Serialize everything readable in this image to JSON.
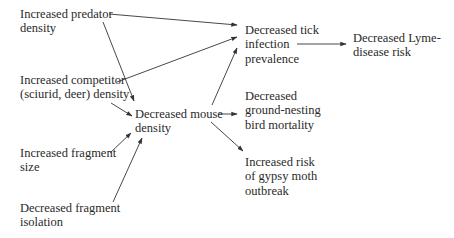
{
  "diagram": {
    "type": "flowchart",
    "nodes": {
      "predator": {
        "lines": [
          "Increased predator",
          "density"
        ]
      },
      "competitor": {
        "lines": [
          "Increased competitor",
          "(sciurid, deer) density"
        ]
      },
      "fragment_size": {
        "lines": [
          "Increased fragment",
          "size"
        ]
      },
      "fragment_isolation": {
        "lines": [
          "Decreased fragment",
          "isolation"
        ]
      },
      "mouse": {
        "lines": [
          "Decreased mouse",
          "density"
        ]
      },
      "tick": {
        "lines": [
          "Decreased tick",
          "infection",
          "prevalence"
        ]
      },
      "lyme": {
        "lines": [
          "Decreased Lyme-",
          "disease risk"
        ]
      },
      "bird": {
        "lines": [
          "Decreased",
          "ground-nesting",
          "bird mortality"
        ]
      },
      "moth": {
        "lines": [
          "Increased risk",
          "of gypsy moth",
          "outbreak"
        ]
      }
    },
    "edges": [
      {
        "from": "predator",
        "to": "tick"
      },
      {
        "from": "predator",
        "to": "mouse"
      },
      {
        "from": "competitor",
        "to": "tick"
      },
      {
        "from": "competitor",
        "to": "mouse"
      },
      {
        "from": "fragment_size",
        "to": "mouse"
      },
      {
        "from": "fragment_isolation",
        "to": "mouse"
      },
      {
        "from": "mouse",
        "to": "tick"
      },
      {
        "from": "mouse",
        "to": "bird"
      },
      {
        "from": "mouse",
        "to": "moth"
      },
      {
        "from": "tick",
        "to": "lyme"
      }
    ]
  }
}
